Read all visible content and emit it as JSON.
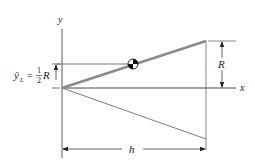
{
  "diagram": {
    "type": "cone-centroid-figure",
    "axes": {
      "y_label": "y",
      "x_label": "x"
    },
    "dimensions": {
      "radius_label": "R",
      "length_label": "h",
      "centroid_label_lhs": "ȳ",
      "centroid_label_sub": "L",
      "centroid_label_eq": "=",
      "centroid_fraction_num": "1",
      "centroid_fraction_den": "2",
      "centroid_label_rhs": "R"
    },
    "elements": {
      "upper_edge": "generating line (highlighted)",
      "lower_edge": "mirror line",
      "centroid_marker": "centroid-symbol"
    },
    "colors": {
      "highlight_line": "#8a8a8a",
      "lines": "#333333"
    }
  }
}
